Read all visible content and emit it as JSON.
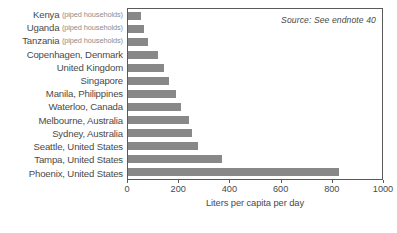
{
  "chart_data": {
    "type": "bar",
    "orientation": "horizontal",
    "title": "",
    "xlabel": "Liters per capita per day",
    "ylabel": "",
    "xlim": [
      0,
      1000
    ],
    "ylim": null,
    "grid": false,
    "legend": null,
    "bar_color": "#888888",
    "categories": [
      "Kenya (piped households)",
      "Uganda (piped households)",
      "Tanzania (piped households)",
      "Copenhagen, Denmark",
      "United Kingdom",
      "Singapore",
      "Manila, Philippines",
      "Waterloo, Canada",
      "Melbourne, Australia",
      "Sydney, Australia",
      "Seattle, United States",
      "Tampa, United States",
      "Phoenix, United States"
    ],
    "values": [
      50,
      62,
      78,
      120,
      140,
      160,
      190,
      210,
      240,
      250,
      275,
      370,
      830
    ],
    "xticks": [
      0,
      200,
      400,
      600,
      800,
      1000
    ],
    "xtick_labels": [
      "0",
      "200",
      "400",
      "600",
      "800",
      "1000"
    ],
    "annotations": [
      {
        "text": "Source: See endnote 40",
        "position": "top-right",
        "style": "italic"
      }
    ]
  },
  "rows": [
    {
      "name": "Kenya",
      "note": "(piped households)",
      "value": 50
    },
    {
      "name": "Uganda",
      "note": "(piped households)",
      "value": 62
    },
    {
      "name": "Tanzania",
      "note": "(piped households)",
      "value": 78
    },
    {
      "name": "Copenhagen, Denmark",
      "note": "",
      "value": 120
    },
    {
      "name": "United Kingdom",
      "note": "",
      "value": 140
    },
    {
      "name": "Singapore",
      "note": "",
      "value": 160
    },
    {
      "name": "Manila, Philippines",
      "note": "",
      "value": 190
    },
    {
      "name": "Waterloo, Canada",
      "note": "",
      "value": 210
    },
    {
      "name": "Melbourne, Australia",
      "note": "",
      "value": 240
    },
    {
      "name": "Sydney, Australia",
      "note": "",
      "value": 250
    },
    {
      "name": "Seattle, United States",
      "note": "",
      "value": 275
    },
    {
      "name": "Tampa, United States",
      "note": "",
      "value": 370
    },
    {
      "name": "Phoenix, United States",
      "note": "",
      "value": 830
    }
  ],
  "axis": {
    "title": "Liters per capita per day",
    "ticks": [
      "0",
      "200",
      "400",
      "600",
      "800",
      "1000"
    ]
  },
  "source": {
    "text": "Source: See endnote 40"
  }
}
